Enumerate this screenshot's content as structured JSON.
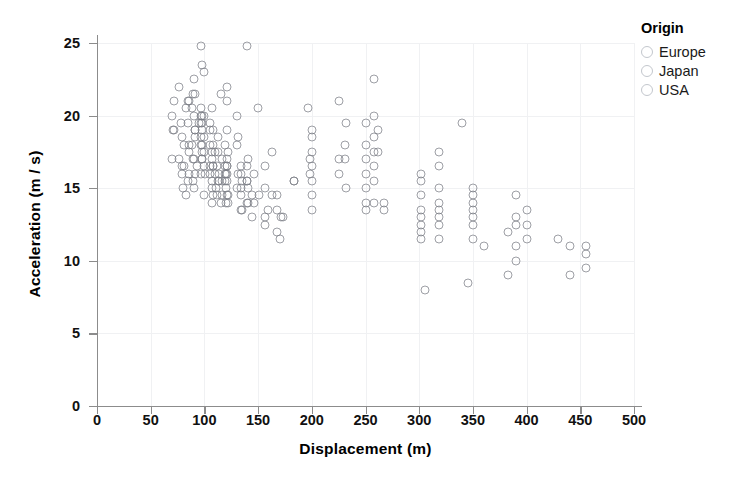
{
  "chart_data": {
    "type": "scatter",
    "title": "",
    "xlabel": "Displacement (m)",
    "ylabel": "Acceleration (m / s)",
    "xlim": [
      0,
      500
    ],
    "ylim": [
      0,
      26.5
    ],
    "xticks": [
      0,
      50,
      100,
      150,
      200,
      250,
      300,
      350,
      400,
      450,
      500
    ],
    "yticks": [
      0,
      5,
      10,
      15,
      20,
      25
    ],
    "grid": true,
    "legend_position": "right",
    "marker": {
      "shape": "open-circle",
      "stroke_color": "#787c84",
      "fill": "none",
      "size_px": 9
    },
    "series": [
      {
        "name": "Europe",
        "color": "#c3c7cd",
        "points": [
          [
            97,
            20.5
          ],
          [
            97,
            20.0
          ],
          [
            98,
            19.5
          ],
          [
            105,
            19.0
          ],
          [
            107,
            20.5
          ],
          [
            108,
            16.5
          ],
          [
            113,
            17.5
          ],
          [
            116,
            14.5
          ],
          [
            116,
            15.5
          ],
          [
            120,
            16.0
          ],
          [
            121,
            14.5
          ],
          [
            121,
            16.5
          ],
          [
            121,
            17.0
          ],
          [
            121,
            19.0
          ],
          [
            121,
            21.0
          ],
          [
            122,
            14.0
          ],
          [
            130,
            18.0
          ],
          [
            131,
            18.5
          ],
          [
            134,
            16.0
          ],
          [
            134,
            15.0
          ],
          [
            140,
            15.5
          ],
          [
            141,
            17.0
          ],
          [
            146,
            14.0
          ],
          [
            156,
            16.5
          ],
          [
            163,
            17.5
          ],
          [
            168,
            13.5
          ],
          [
            183,
            15.5
          ],
          [
            97,
            18.5
          ],
          [
            91,
            19.0
          ],
          [
            79,
            16.5
          ],
          [
            89,
            17.0
          ],
          [
            100,
            20.0
          ],
          [
            98,
            17.0
          ],
          [
            86,
            18.0
          ],
          [
            90,
            15.0
          ],
          [
            115,
            21.5
          ],
          [
            130,
            20.0
          ],
          [
            107,
            17.5
          ],
          [
            135,
            13.5
          ],
          [
            119,
            18.0
          ],
          [
            114,
            16.0
          ],
          [
            121,
            22.0
          ],
          [
            108,
            18.0
          ],
          [
            105,
            16.5
          ],
          [
            107,
            15.0
          ]
        ]
      },
      {
        "name": "Japan",
        "color": "#c3c7cd",
        "points": [
          [
            71,
            19.0
          ],
          [
            72,
            19.0
          ],
          [
            72,
            21.0
          ],
          [
            76,
            17.0
          ],
          [
            79,
            16.0
          ],
          [
            79,
            18.5
          ],
          [
            80,
            15.0
          ],
          [
            81,
            16.5
          ],
          [
            83,
            20.5
          ],
          [
            85,
            19.5
          ],
          [
            86,
            17.5
          ],
          [
            86,
            16.0
          ],
          [
            88,
            18.0
          ],
          [
            89,
            15.5
          ],
          [
            90,
            17.0
          ],
          [
            91,
            21.5
          ],
          [
            91,
            18.5
          ],
          [
            93,
            16.5
          ],
          [
            95,
            19.5
          ],
          [
            97,
            16.0
          ],
          [
            97,
            18.0
          ],
          [
            98,
            17.5
          ],
          [
            98,
            20.0
          ],
          [
            100,
            14.5
          ],
          [
            100,
            16.5
          ],
          [
            105,
            16.0
          ],
          [
            107,
            14.0
          ],
          [
            108,
            16.5
          ],
          [
            108,
            19.0
          ],
          [
            110,
            17.5
          ],
          [
            112,
            14.5
          ],
          [
            113,
            15.5
          ],
          [
            119,
            15.5
          ],
          [
            119,
            16.5
          ],
          [
            120,
            14.0
          ],
          [
            134,
            13.5
          ],
          [
            134,
            16.5
          ],
          [
            140,
            15.5
          ],
          [
            141,
            14.0
          ],
          [
            144,
            13.0
          ],
          [
            156,
            12.5
          ],
          [
            168,
            14.5
          ],
          [
            70,
            17.0
          ],
          [
            70,
            20.0
          ],
          [
            76,
            22.0
          ],
          [
            78,
            19.5
          ],
          [
            81,
            18.0
          ],
          [
            83,
            14.5
          ],
          [
            85,
            15.5
          ],
          [
            91,
            16.0
          ]
        ]
      },
      {
        "name": "USA",
        "color": "#c3c7cd",
        "points": [
          [
            97,
            24.8
          ],
          [
            140,
            24.8
          ],
          [
            90,
            22.5
          ],
          [
            98,
            23.5
          ],
          [
            100,
            23.0
          ],
          [
            85,
            21.0
          ],
          [
            86,
            21.0
          ],
          [
            88,
            20.5
          ],
          [
            89,
            21.5
          ],
          [
            90,
            20.0
          ],
          [
            91,
            19.0
          ],
          [
            97,
            19.5
          ],
          [
            98,
            19.0
          ],
          [
            98,
            18.0
          ],
          [
            98,
            17.0
          ],
          [
            100,
            18.5
          ],
          [
            100,
            17.5
          ],
          [
            101,
            16.0
          ],
          [
            105,
            19.5
          ],
          [
            105,
            18.0
          ],
          [
            107,
            15.5
          ],
          [
            107,
            17.0
          ],
          [
            108,
            14.5
          ],
          [
            110,
            16.0
          ],
          [
            111,
            15.0
          ],
          [
            112,
            16.5
          ],
          [
            113,
            18.5
          ],
          [
            114,
            15.5
          ],
          [
            115,
            14.0
          ],
          [
            116,
            17.0
          ],
          [
            119,
            16.0
          ],
          [
            120,
            15.0
          ],
          [
            121,
            15.5
          ],
          [
            121,
            16.0
          ],
          [
            121,
            16.5
          ],
          [
            122,
            14.5
          ],
          [
            122,
            17.5
          ],
          [
            130,
            15.0
          ],
          [
            131,
            16.0
          ],
          [
            134,
            14.5
          ],
          [
            135,
            15.5
          ],
          [
            140,
            14.0
          ],
          [
            140,
            16.5
          ],
          [
            141,
            15.0
          ],
          [
            144,
            14.5
          ],
          [
            146,
            16.0
          ],
          [
            150,
            20.5
          ],
          [
            151,
            14.5
          ],
          [
            156,
            15.0
          ],
          [
            156,
            13.0
          ],
          [
            159,
            13.5
          ],
          [
            163,
            14.5
          ],
          [
            168,
            12.0
          ],
          [
            170,
            11.5
          ],
          [
            171,
            13.0
          ],
          [
            173,
            13.0
          ],
          [
            183,
            15.5
          ],
          [
            196,
            20.5
          ],
          [
            198,
            17.0
          ],
          [
            198,
            16.0
          ],
          [
            200,
            18.5
          ],
          [
            200,
            17.5
          ],
          [
            200,
            16.5
          ],
          [
            200,
            15.5
          ],
          [
            200,
            14.5
          ],
          [
            200,
            13.5
          ],
          [
            200,
            19.0
          ],
          [
            225,
            21.0
          ],
          [
            225,
            16.0
          ],
          [
            231,
            18.0
          ],
          [
            231,
            17.0
          ],
          [
            232,
            19.5
          ],
          [
            232,
            15.0
          ],
          [
            250,
            19.5
          ],
          [
            250,
            18.0
          ],
          [
            250,
            17.0
          ],
          [
            250,
            16.0
          ],
          [
            250,
            15.0
          ],
          [
            250,
            14.0
          ],
          [
            250,
            13.5
          ],
          [
            258,
            22.5
          ],
          [
            258,
            20.0
          ],
          [
            258,
            18.5
          ],
          [
            258,
            17.5
          ],
          [
            258,
            16.5
          ],
          [
            258,
            15.5
          ],
          [
            258,
            14.0
          ],
          [
            262,
            19.0
          ],
          [
            267,
            13.5
          ],
          [
            302,
            15.5
          ],
          [
            302,
            14.5
          ],
          [
            302,
            13.5
          ],
          [
            302,
            12.5
          ],
          [
            302,
            11.5
          ],
          [
            302,
            16.0
          ],
          [
            302,
            13.0
          ],
          [
            302,
            12.0
          ],
          [
            305,
            8.0
          ],
          [
            318,
            16.5
          ],
          [
            318,
            15.0
          ],
          [
            318,
            14.0
          ],
          [
            318,
            13.5
          ],
          [
            318,
            12.5
          ],
          [
            318,
            11.5
          ],
          [
            318,
            13.0
          ],
          [
            318,
            17.5
          ],
          [
            340,
            19.5
          ],
          [
            345,
            8.5
          ],
          [
            350,
            14.5
          ],
          [
            350,
            13.5
          ],
          [
            350,
            13.0
          ],
          [
            350,
            12.5
          ],
          [
            350,
            11.5
          ],
          [
            350,
            15.0
          ],
          [
            350,
            14.0
          ],
          [
            360,
            11.0
          ],
          [
            383,
            12.0
          ],
          [
            390,
            12.5
          ],
          [
            390,
            13.0
          ],
          [
            390,
            11.0
          ],
          [
            390,
            14.5
          ],
          [
            390,
            10.0
          ],
          [
            400,
            12.5
          ],
          [
            400,
            11.5
          ],
          [
            400,
            13.5
          ],
          [
            429,
            11.5
          ],
          [
            440,
            11.0
          ],
          [
            440,
            9.0
          ],
          [
            455,
            11.0
          ],
          [
            455,
            10.5
          ],
          [
            455,
            9.5
          ],
          [
            383,
            9.0
          ],
          [
            225,
            17.0
          ],
          [
            262,
            17.5
          ],
          [
            267,
            14.0
          ]
        ]
      }
    ]
  },
  "legend": {
    "title": "Origin",
    "entries": [
      {
        "label": "Europe",
        "marker": "open-circle-icon"
      },
      {
        "label": "Japan",
        "marker": "open-circle-icon"
      },
      {
        "label": "USA",
        "marker": "open-circle-icon"
      }
    ]
  },
  "axes": {
    "x_title": "Displacement (m)",
    "y_title": "Acceleration (m / s)",
    "x_tick_labels": [
      "0",
      "50",
      "100",
      "150",
      "200",
      "250",
      "300",
      "350",
      "400",
      "450",
      "500"
    ],
    "y_tick_labels": [
      "0",
      "5",
      "10",
      "15",
      "20",
      "25"
    ]
  }
}
